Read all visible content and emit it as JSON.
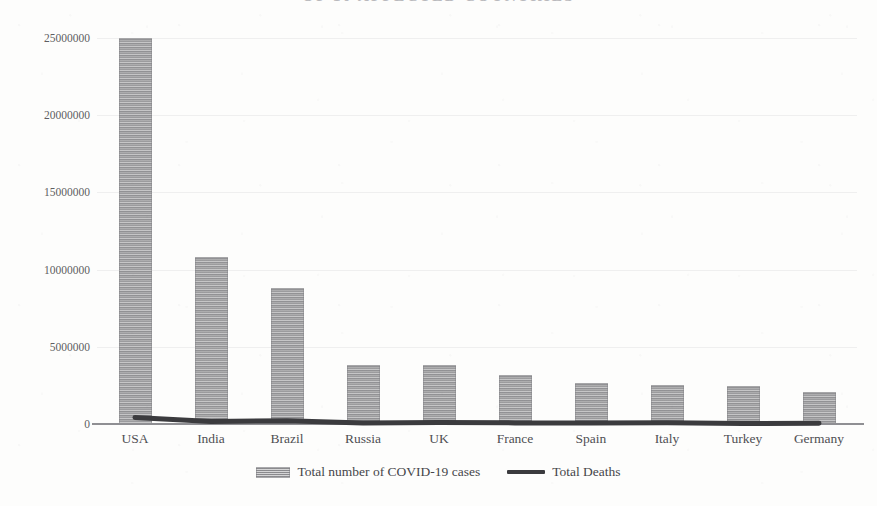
{
  "chart_data": {
    "type": "bar",
    "title_visible_fragment": "OP 10 AFFECTED COUNTRIES",
    "xlabel": "",
    "ylabel": "",
    "ylim": [
      0,
      25000000
    ],
    "grid": true,
    "legend_position": "bottom",
    "categories": [
      "USA",
      "India",
      "Brazil",
      "Russia",
      "UK",
      "France",
      "Spain",
      "Italy",
      "Turkey",
      "Germany"
    ],
    "y_ticks": [
      0,
      5000000,
      10000000,
      15000000,
      20000000,
      25000000
    ],
    "y_tick_labels": [
      "0",
      "5000000",
      "10000000",
      "15000000",
      "20000000",
      "25000000"
    ],
    "series": [
      {
        "name": "Total number of COVID-19 cases",
        "kind": "bar",
        "color": "#9d9d9f",
        "values": [
          25000000,
          10800000,
          8800000,
          3800000,
          3800000,
          3150000,
          2650000,
          2500000,
          2450000,
          2050000
        ]
      },
      {
        "name": "Total Deaths",
        "kind": "line",
        "color": "#3b3b3e",
        "values": [
          420000,
          155000,
          216000,
          72000,
          100000,
          74000,
          56000,
          86000,
          25000,
          54000
        ]
      }
    ]
  },
  "legend": {
    "entries": [
      {
        "label": "Total number of COVID-19 cases",
        "swatch": "striped-bar-swatch"
      },
      {
        "label": "Total Deaths",
        "swatch": "solid-line-swatch"
      }
    ]
  },
  "colors": {
    "bar_fill": "#9d9d9f",
    "line_stroke": "#3b3b3e",
    "axis": "#8f8f93",
    "text": "#4f4f53",
    "background": "#fdfdfc"
  }
}
